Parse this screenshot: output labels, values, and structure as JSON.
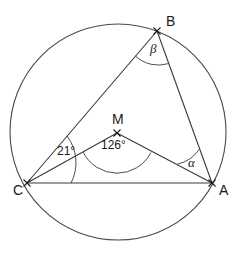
{
  "figure": {
    "kind": "circle-geometry-diagram",
    "background_color": "#ffffff",
    "stroke_color": "#3a3a3a",
    "text_color": "#1a1a1a"
  },
  "circle": {
    "name": "circumscribed-circle",
    "center_x": 118,
    "center_y": 132,
    "radius": 108
  },
  "points": [
    {
      "id": "A",
      "label": "A",
      "x": 212,
      "y": 183,
      "label_x": 219,
      "label_y": 183,
      "marker": "x"
    },
    {
      "id": "B",
      "label": "B",
      "x": 157,
      "y": 31,
      "label_x": 166,
      "label_y": 23,
      "marker": "x"
    },
    {
      "id": "C",
      "label": "C",
      "x": 27,
      "y": 183,
      "label_x": 13,
      "label_y": 190,
      "marker": "x"
    },
    {
      "id": "M",
      "label": "M",
      "x": 117,
      "y": 133,
      "label_x": 112,
      "label_y": 118,
      "marker": "x"
    }
  ],
  "segments": [
    {
      "name": "segment-CB",
      "from": "C",
      "to": "B"
    },
    {
      "name": "segment-BA",
      "from": "B",
      "to": "A"
    },
    {
      "name": "segment-CA",
      "from": "C",
      "to": "A"
    },
    {
      "name": "segment-MC",
      "from": "M",
      "to": "C"
    },
    {
      "name": "segment-MA",
      "from": "M",
      "to": "A"
    }
  ],
  "angles": [
    {
      "name": "angle-at-C",
      "vertex": "C",
      "value": "21°",
      "label_x": 57,
      "label_y": 145,
      "arc_radius": 44,
      "style": "numeric"
    },
    {
      "name": "angle-at-M",
      "vertex": "M",
      "value": "126°",
      "label_x": 101,
      "label_y": 139,
      "arc_radius": 38,
      "style": "numeric"
    },
    {
      "name": "angle-at-A",
      "vertex": "A",
      "value": "α",
      "label_x": 188,
      "label_y": 156,
      "arc_radius": 36,
      "style": "greek"
    },
    {
      "name": "angle-at-B",
      "vertex": "B",
      "value": "β",
      "label_x": 150,
      "label_y": 42,
      "arc_radius": 34,
      "style": "greek"
    }
  ]
}
